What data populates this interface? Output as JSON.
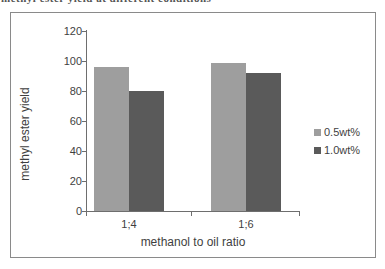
{
  "caption_fragment": "methyl ester yield at different conditions",
  "chart_data": {
    "type": "bar",
    "categories": [
      "1;4",
      "1;6"
    ],
    "series": [
      {
        "name": "0.5wt%",
        "values": [
          96,
          99
        ],
        "color": "#9e9e9e"
      },
      {
        "name": "1.0wt%",
        "values": [
          80,
          92
        ],
        "color": "#5a5a5a"
      }
    ],
    "title": "",
    "xlabel": "methanol to oil ratio",
    "ylabel": "methyl ester yield",
    "ylim": [
      0,
      120
    ],
    "yticks": [
      0,
      20,
      40,
      60,
      80,
      100,
      120
    ],
    "grid": false,
    "legend_position": "right",
    "colors": {
      "frame_border": "#8a8a8a",
      "axis": "#6e6e6e",
      "text": "#3f3f3f"
    }
  }
}
